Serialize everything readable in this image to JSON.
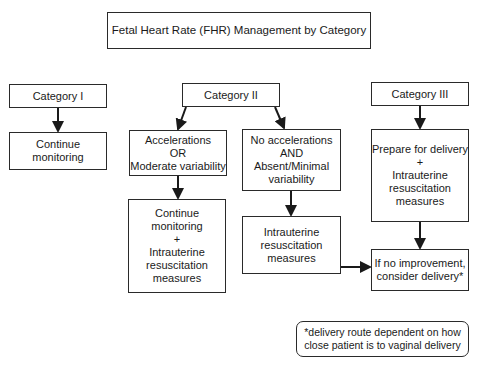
{
  "title": "Fetal Heart Rate (FHR) Management by Category",
  "categories": {
    "cat1": {
      "label": "Category I",
      "action": "Continue\nmonitoring"
    },
    "cat2": {
      "label": "Category II",
      "branch_a": {
        "condition": "Accelerations\nOR\nModerate variability",
        "action": "Continue\nmonitoring\n+\nIntrauterine\nresuscitation\nmeasures"
      },
      "branch_b": {
        "condition": "No accelerations\nAND\nAbsent/Minimal\nvariability",
        "action": "Intrauterine\nresuscitation\nmeasures"
      }
    },
    "cat3": {
      "label": "Category III",
      "action": "Prepare for delivery\n+\nIntrauterine\nresuscitation\nmeasures"
    }
  },
  "outcome": "If no improvement,\nconsider delivery*",
  "footnote": "*delivery route dependent on how\nclose patient is to vaginal delivery",
  "colors": {
    "line": "#1a1a1a",
    "border": "#2a2a2a",
    "background": "#ffffff"
  }
}
